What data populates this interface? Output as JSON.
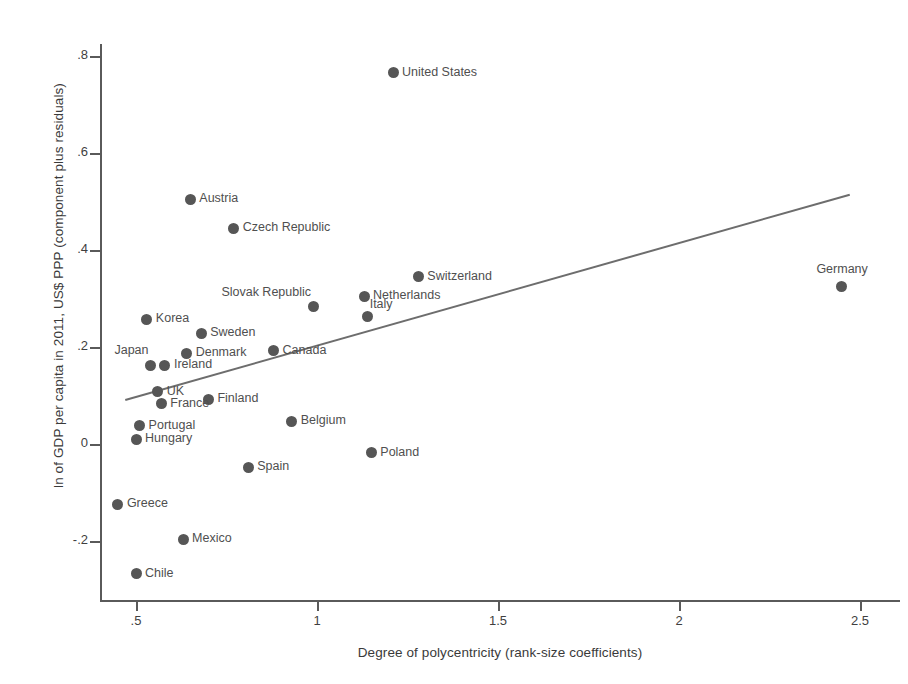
{
  "chart_data": {
    "type": "scatter",
    "title": "",
    "xlabel": "Degree of polycentricity (rank-size coefficients)",
    "ylabel": "ln of GDP per capita in 2011, US$ PPP (component plus residuals)",
    "xlim": [
      0.43,
      2.63
    ],
    "ylim": [
      -0.32,
      0.85
    ],
    "xticks": [
      ".5",
      "1",
      "1.5",
      "2",
      "2.5"
    ],
    "xtick_values": [
      0.5,
      1.0,
      1.5,
      2.0,
      2.5
    ],
    "yticks": [
      ".8",
      ".6",
      ".4",
      ".2",
      "0",
      "-.2"
    ],
    "ytick_values": [
      0.8,
      0.6,
      0.4,
      0.2,
      0.0,
      -0.2
    ],
    "grid": false,
    "legend": "none",
    "marker_color": "#565656",
    "fitline_color": "#6d6d6d",
    "fit_line": {
      "x0": 0.47,
      "y0": 0.092,
      "x1": 2.47,
      "y1": 0.515
    },
    "points": [
      {
        "label": "United States",
        "x": 1.21,
        "y": 0.765,
        "label_pos": "right"
      },
      {
        "label": "Austria",
        "x": 0.65,
        "y": 0.505,
        "label_pos": "right"
      },
      {
        "label": "Czech Republic",
        "x": 0.77,
        "y": 0.445,
        "label_pos": "right"
      },
      {
        "label": "Switzerland",
        "x": 1.28,
        "y": 0.345,
        "label_pos": "right"
      },
      {
        "label": "Germany",
        "x": 2.45,
        "y": 0.325,
        "label_pos": "above"
      },
      {
        "label": "Netherlands",
        "x": 1.13,
        "y": 0.305,
        "label_pos": "right"
      },
      {
        "label": "Slovak Republic",
        "x": 0.99,
        "y": 0.283,
        "label_pos": "above-left"
      },
      {
        "label": "Italy",
        "x": 1.14,
        "y": 0.262,
        "label_pos": "above-right"
      },
      {
        "label": "Korea",
        "x": 0.53,
        "y": 0.257,
        "label_pos": "right"
      },
      {
        "label": "Sweden",
        "x": 0.68,
        "y": 0.228,
        "label_pos": "right"
      },
      {
        "label": "Denmark",
        "x": 0.64,
        "y": 0.187,
        "label_pos": "right"
      },
      {
        "label": "Canada",
        "x": 0.88,
        "y": 0.192,
        "label_pos": "right"
      },
      {
        "label": "Japan",
        "x": 0.54,
        "y": 0.162,
        "label_pos": "above-left"
      },
      {
        "label": "Ireland",
        "x": 0.58,
        "y": 0.162,
        "label_pos": "right"
      },
      {
        "label": "UK",
        "x": 0.56,
        "y": 0.108,
        "label_pos": "right"
      },
      {
        "label": "Finland",
        "x": 0.7,
        "y": 0.092,
        "label_pos": "right"
      },
      {
        "label": "France",
        "x": 0.57,
        "y": 0.083,
        "label_pos": "right"
      },
      {
        "label": "Belgium",
        "x": 0.93,
        "y": 0.047,
        "label_pos": "right"
      },
      {
        "label": "Portugal",
        "x": 0.51,
        "y": 0.038,
        "label_pos": "right"
      },
      {
        "label": "Hungary",
        "x": 0.5,
        "y": 0.01,
        "label_pos": "right"
      },
      {
        "label": "Poland",
        "x": 1.15,
        "y": -0.018,
        "label_pos": "right"
      },
      {
        "label": "Spain",
        "x": 0.81,
        "y": -0.048,
        "label_pos": "right"
      },
      {
        "label": "Greece",
        "x": 0.45,
        "y": -0.124,
        "label_pos": "right"
      },
      {
        "label": "Mexico",
        "x": 0.63,
        "y": -0.196,
        "label_pos": "right"
      },
      {
        "label": "Chile",
        "x": 0.5,
        "y": -0.268,
        "label_pos": "right"
      }
    ]
  }
}
